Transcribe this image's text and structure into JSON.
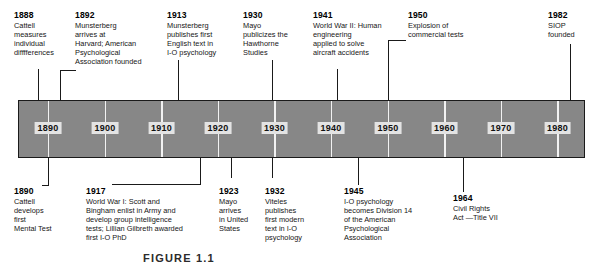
{
  "figure": {
    "caption": "FIGURE 1.1",
    "bar": {
      "fill_color": "#878787",
      "border_color": "#1a1a1a",
      "tick_color": "#f2f2f2",
      "year_box_color": "#e3e3e3"
    },
    "axis": {
      "label": "Decade markers",
      "ticks": [
        {
          "year": "1890",
          "x": 48
        },
        {
          "year": "1900",
          "x": 105
        },
        {
          "year": "1910",
          "x": 161
        },
        {
          "year": "1920",
          "x": 218
        },
        {
          "year": "1930",
          "x": 274
        },
        {
          "year": "1940",
          "x": 331
        },
        {
          "year": "1950",
          "x": 388
        },
        {
          "year": "1960",
          "x": 444
        },
        {
          "year": "1970",
          "x": 501
        },
        {
          "year": "1980",
          "x": 557
        }
      ]
    },
    "events_above": [
      {
        "year": "1888",
        "text": "Cattell\nmeasures\nindividual\ndifffferences"
      },
      {
        "year": "1892",
        "text": "Munsterberg\narrives at\nHarvard; American\nPsychological\nAssociation founded"
      },
      {
        "year": "1913",
        "text": "Munsterberg\npublishes first\nEnglish text in\nI-O psychology"
      },
      {
        "year": "1930",
        "text": "Mayo\npublicizes the\nHawthorne\nStudies"
      },
      {
        "year": "1941",
        "text": "World War II: Human\nengineering\napplied to solve\naircraft accidents"
      },
      {
        "year": "1950",
        "text": "Explosion of\ncommercial tests"
      },
      {
        "year": "1982",
        "text": "SIOP\nfounded"
      }
    ],
    "events_below": [
      {
        "year": "1890",
        "text": "Cattell\ndevelops\nfirst\nMental Test"
      },
      {
        "year": "1917",
        "text": "World War I: Scott and\nBingham enlist in Army and\ndevelop group intelligence\ntests; Lillian Gilbreth awarded\nfirst I-O PhD"
      },
      {
        "year": "1923",
        "text": "Mayo\narrives\nin United\nStates"
      },
      {
        "year": "1932",
        "text": "Viteles\npublishes\nfirst modern\ntext in I-O\npsychology"
      },
      {
        "year": "1945",
        "text": "I-O psychology\nbecomes Division 14\nof the American\nPsychological\nAssociation"
      },
      {
        "year": "1964",
        "text": "Civil Rights\nAct —Title VII"
      }
    ]
  }
}
